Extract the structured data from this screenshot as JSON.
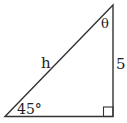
{
  "diagram": {
    "type": "right-triangle",
    "labels": {
      "hypotenuse": "h",
      "vertical_side": "5",
      "bottom_left_angle": "45°",
      "top_angle": "θ"
    },
    "right_angle_marker": true,
    "stroke_color": "#333333"
  }
}
